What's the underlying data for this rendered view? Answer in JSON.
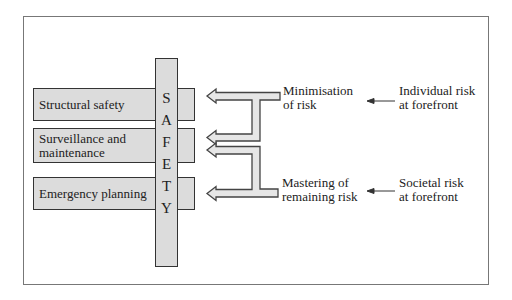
{
  "diagram": {
    "center_label_letters": [
      "S",
      "A",
      "F",
      "E",
      "T",
      "Y"
    ],
    "rows": [
      {
        "label": "Structural safety"
      },
      {
        "label_line1": "Surveillance and",
        "label_line2": "maintenance"
      },
      {
        "label": "Emergency planning"
      }
    ],
    "strategies": [
      {
        "line1": "Minimisation",
        "line2": "of risk"
      },
      {
        "line1": "Mastering of",
        "line2": "remaining risk"
      }
    ],
    "drivers": [
      {
        "line1": "Individual risk",
        "line2": "at forefront"
      },
      {
        "line1": "Societal risk",
        "line2": "at forefront"
      }
    ],
    "colors": {
      "box_fill": "#dcdcdc",
      "box_stroke": "#333333",
      "frame_stroke": "#777777",
      "arrow_fill": "#e6e6e6"
    }
  }
}
